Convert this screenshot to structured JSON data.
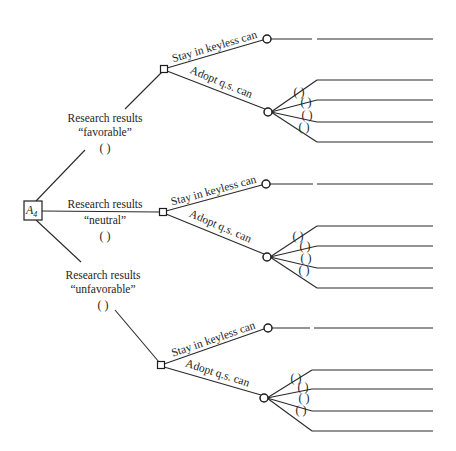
{
  "diagram": {
    "type": "decision-tree",
    "root": {
      "label": "A",
      "subscript": "4",
      "box": {
        "x": 24,
        "y": 201,
        "w": 18,
        "h": 19
      }
    },
    "research_outcomes": [
      {
        "id": "favorable",
        "label_line1": "Research results",
        "label_line2": "“favorable”",
        "probability_blank": "( )",
        "label_pos": {
          "x": 105,
          "y1": 122,
          "y2": 136,
          "y3": 152
        },
        "edge": {
          "x1": 36,
          "y1": 201,
          "x2": 85,
          "y2": 150,
          "x3": 125,
          "y3": 109
        },
        "decision_node": {
          "x": 164,
          "y": 69
        },
        "alternatives": {
          "stay": {
            "label": "Stay in keyless can",
            "chance_node": {
              "x": 267,
              "y": 39
            },
            "outcome_line": {
              "x1": 271,
              "x2": 312,
              "x3": 317,
              "x4": 433,
              "y": 39
            }
          },
          "adopt": {
            "label": "Adopt q.s. can",
            "chance_node": {
              "x": 268,
              "y": 112
            },
            "branches": [
              {
                "probability_blank": "( )",
                "end_y": 80,
                "paren_x": 299,
                "paren_y": 96
              },
              {
                "probability_blank": "( )",
                "end_y": 100,
                "paren_x": 306,
                "paren_y": 106
              },
              {
                "probability_blank": "( )",
                "end_y": 122,
                "paren_x": 307,
                "paren_y": 119
              },
              {
                "probability_blank": "( )",
                "end_y": 142,
                "paren_x": 304,
                "paren_y": 131
              }
            ],
            "end_x1": 317,
            "end_x2": 433
          }
        }
      },
      {
        "id": "neutral",
        "label_line1": "Research results",
        "label_line2": "“neutral”",
        "probability_blank": "( )",
        "label_pos": {
          "x": 105,
          "y1": 208,
          "y2": 224,
          "y3": 240
        },
        "edge": {
          "x1": 42,
          "y1": 211,
          "x2": 159,
          "y2": 212
        },
        "decision_node": {
          "x": 163,
          "y": 212
        },
        "alternatives": {
          "stay": {
            "label": "Stay in keyless can",
            "chance_node": {
              "x": 266,
              "y": 184
            },
            "outcome_line": {
              "x1": 270,
              "x2": 313,
              "x3": 317,
              "x4": 433,
              "y": 184
            }
          },
          "adopt": {
            "label": "Adopt q.s. can",
            "chance_node": {
              "x": 267,
              "y": 257
            },
            "branches": [
              {
                "probability_blank": "( )",
                "end_y": 226,
                "paren_x": 298,
                "paren_y": 240
              },
              {
                "probability_blank": "( )",
                "end_y": 246,
                "paren_x": 305,
                "paren_y": 250
              },
              {
                "probability_blank": "( )",
                "end_y": 268,
                "paren_x": 306,
                "paren_y": 262
              },
              {
                "probability_blank": "( )",
                "end_y": 288,
                "paren_x": 304,
                "paren_y": 274
              }
            ],
            "end_x1": 317,
            "end_x2": 433
          }
        }
      },
      {
        "id": "unfavorable",
        "label_line1": "Research results",
        "label_line2": "“unfavorable”",
        "probability_blank": "( )",
        "label_pos": {
          "x": 103,
          "y1": 279,
          "y2": 293,
          "y3": 309
        },
        "edge": {
          "x1": 36,
          "y1": 220,
          "x2": 81,
          "y2": 262,
          "x3": 115,
          "y3": 310
        },
        "decision_node": {
          "x": 161,
          "y": 365
        },
        "alternatives": {
          "stay": {
            "label": "Stay in keyless can",
            "chance_node": {
              "x": 268,
              "y": 328
            },
            "outcome_line": {
              "x1": 272,
              "x2": 310,
              "x3": 314,
              "x4": 433,
              "y": 328
            }
          },
          "adopt": {
            "label": "Adopt q.s. can",
            "chance_node": {
              "x": 264,
              "y": 398
            },
            "branches": [
              {
                "probability_blank": "( )",
                "end_y": 370,
                "paren_x": 296,
                "paren_y": 382
              },
              {
                "probability_blank": "( )",
                "end_y": 389,
                "paren_x": 303,
                "paren_y": 391
              },
              {
                "probability_blank": "( )",
                "end_y": 411,
                "paren_x": 304,
                "paren_y": 402
              },
              {
                "probability_blank": "( )",
                "end_y": 431,
                "paren_x": 301,
                "paren_y": 414
              }
            ],
            "end_x1": 312,
            "end_x2": 433
          }
        }
      }
    ]
  }
}
